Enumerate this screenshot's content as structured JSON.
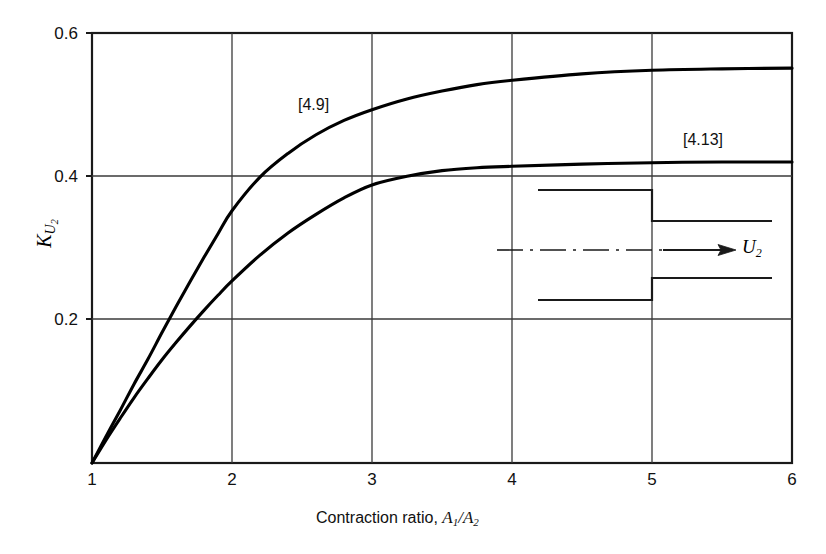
{
  "chart_data": {
    "type": "line",
    "title": "",
    "xlabel": "Contraction ratio, A₁/A₂",
    "ylabel": "K_U2",
    "xlim": [
      1,
      6
    ],
    "ylim": [
      0,
      0.6
    ],
    "grid": true,
    "legend_position": "inline-annotation",
    "xticks": [
      "1",
      "2",
      "3",
      "4",
      "5",
      "6"
    ],
    "xtick_values": [
      1,
      2,
      3,
      4,
      5,
      6
    ],
    "yticks": [
      "0.2",
      "0.4",
      "0.6"
    ],
    "ytick_values": [
      0.2,
      0.4,
      0.6
    ],
    "series": [
      {
        "name": "[4.9]",
        "label": "[4.9]",
        "x": [
          1.0,
          1.1,
          1.2,
          1.3,
          1.4,
          1.5,
          1.6,
          1.7,
          1.8,
          1.9,
          2.0,
          2.2,
          2.4,
          2.6,
          2.8,
          3.0,
          3.25,
          3.5,
          3.75,
          4.0,
          4.5,
          5.0,
          5.5,
          6.0
        ],
        "values": [
          0.0,
          0.037,
          0.073,
          0.11,
          0.145,
          0.182,
          0.218,
          0.253,
          0.287,
          0.32,
          0.352,
          0.399,
          0.432,
          0.458,
          0.478,
          0.493,
          0.508,
          0.519,
          0.528,
          0.534,
          0.543,
          0.548,
          0.55,
          0.551
        ]
      },
      {
        "name": "[4.13]",
        "label": "[4.13]",
        "x": [
          1.0,
          1.1,
          1.2,
          1.3,
          1.4,
          1.5,
          1.6,
          1.7,
          1.8,
          1.9,
          2.0,
          2.2,
          2.4,
          2.6,
          2.8,
          3.0,
          3.25,
          3.5,
          3.75,
          4.0,
          4.5,
          5.0,
          5.5,
          6.0
        ],
        "values": [
          0.0,
          0.032,
          0.062,
          0.091,
          0.118,
          0.144,
          0.168,
          0.191,
          0.213,
          0.234,
          0.254,
          0.29,
          0.321,
          0.347,
          0.37,
          0.388,
          0.4,
          0.408,
          0.412,
          0.414,
          0.417,
          0.419,
          0.42,
          0.42
        ]
      }
    ],
    "annotations": [
      {
        "text": "[4.9]",
        "x": 3.25,
        "y": 0.525,
        "name": "curve-label-4-9"
      },
      {
        "text": "[4.13]",
        "x": 5.3,
        "y": 0.43,
        "name": "curve-label-4-13"
      }
    ],
    "inset": {
      "name": "pipe-contraction-diagram",
      "flow_label": "U",
      "flow_label_sub": "2"
    }
  },
  "axes": {
    "y_label_main": "K",
    "y_label_sub_u": "U",
    "y_label_sub_2": "2",
    "x_label_text": "Contraction ratio, ",
    "x_label_a1": "A",
    "x_label_sub1": "1",
    "x_label_slash": "/",
    "x_label_a2": "A",
    "x_label_sub2": "2"
  },
  "colors": {
    "background": "#ffffff",
    "axis": "#1a1a1a",
    "grid": "#4a4a4a",
    "curve": "#000000",
    "text": "#111111"
  }
}
